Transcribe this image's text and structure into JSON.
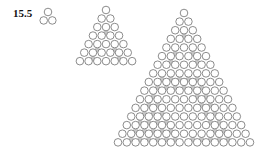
{
  "figure": {
    "label": "15.5",
    "colors": {
      "stroke": "#6e6e6e",
      "fill": "#ffffff",
      "shade": "#c8c8c8"
    },
    "circle_radius": 3.8,
    "triangles": [
      {
        "name": "small",
        "rows": 2,
        "apex_x": 48,
        "apex_y": 12,
        "spacing": 8.6,
        "shaded": []
      },
      {
        "name": "medium",
        "rows": 7,
        "apex_x": 106,
        "apex_y": 10,
        "spacing": 8.7,
        "shaded": [
          [
            2,
            1
          ],
          [
            4,
            1
          ],
          [
            4,
            3
          ],
          [
            5,
            1
          ],
          [
            5,
            4
          ]
        ]
      },
      {
        "name": "large",
        "rows": 16,
        "apex_x": 184,
        "apex_y": 13,
        "spacing": 8.8,
        "shaded": [
          [
            2,
            1
          ],
          [
            4,
            1
          ],
          [
            4,
            3
          ],
          [
            5,
            1
          ],
          [
            5,
            4
          ],
          [
            7,
            1
          ],
          [
            7,
            2
          ],
          [
            7,
            3
          ],
          [
            7,
            4
          ],
          [
            7,
            5
          ],
          [
            8,
            1
          ],
          [
            8,
            2
          ],
          [
            8,
            3
          ],
          [
            8,
            4
          ],
          [
            8,
            5
          ],
          [
            8,
            6
          ],
          [
            9,
            1
          ],
          [
            9,
            6
          ],
          [
            9,
            7
          ],
          [
            10,
            1
          ],
          [
            10,
            2
          ],
          [
            10,
            7
          ],
          [
            10,
            8
          ],
          [
            11,
            1
          ],
          [
            11,
            2
          ],
          [
            11,
            3
          ],
          [
            11,
            8
          ],
          [
            11,
            9
          ],
          [
            12,
            1
          ],
          [
            12,
            2
          ],
          [
            12,
            3
          ],
          [
            12,
            4
          ],
          [
            12,
            9
          ],
          [
            12,
            10
          ],
          [
            13,
            1
          ],
          [
            13,
            2
          ],
          [
            13,
            3
          ],
          [
            13,
            4
          ],
          [
            13,
            5
          ],
          [
            13,
            10
          ],
          [
            13,
            11
          ],
          [
            14,
            1
          ],
          [
            14,
            2
          ],
          [
            14,
            3
          ],
          [
            14,
            4
          ],
          [
            14,
            5
          ],
          [
            14,
            6
          ],
          [
            14,
            8
          ],
          [
            14,
            9
          ],
          [
            14,
            10
          ],
          [
            14,
            11
          ],
          [
            14,
            12
          ]
        ]
      }
    ]
  }
}
